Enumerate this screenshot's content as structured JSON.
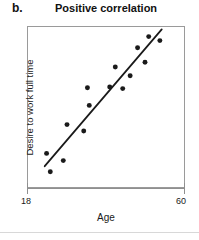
{
  "panel": {
    "letter": "b."
  },
  "chart_data": {
    "type": "scatter",
    "title": "Positive correlation",
    "xlabel": "Age",
    "ylabel": "Desire to work full time",
    "xlim": [
      18,
      60
    ],
    "ylim": [
      0,
      100
    ],
    "xticks": [
      18,
      60
    ],
    "xtick_labels": [
      "18",
      "60"
    ],
    "yticks": [],
    "ytick_labels": [],
    "grid": false,
    "legend": false,
    "point_color": "#1a1a1a",
    "point_size_px": 5,
    "trendline": {
      "visible": true,
      "color": "#1a1a1a",
      "width_px": 1.8,
      "x_start": 22.5,
      "y_start": 13.0,
      "x_end": 54.0,
      "y_end": 98.5
    },
    "points": [
      {
        "x": 23.0,
        "y": 21.0
      },
      {
        "x": 24.0,
        "y": 9.5
      },
      {
        "x": 27.5,
        "y": 16.5
      },
      {
        "x": 28.5,
        "y": 39.0
      },
      {
        "x": 33.0,
        "y": 35.0
      },
      {
        "x": 34.5,
        "y": 51.0
      },
      {
        "x": 34.0,
        "y": 62.0
      },
      {
        "x": 40.0,
        "y": 62.5
      },
      {
        "x": 41.5,
        "y": 75.0
      },
      {
        "x": 43.5,
        "y": 61.5
      },
      {
        "x": 45.5,
        "y": 69.5
      },
      {
        "x": 47.5,
        "y": 87.0
      },
      {
        "x": 49.5,
        "y": 78.0
      },
      {
        "x": 50.5,
        "y": 94.0
      },
      {
        "x": 53.5,
        "y": 91.5
      }
    ]
  }
}
